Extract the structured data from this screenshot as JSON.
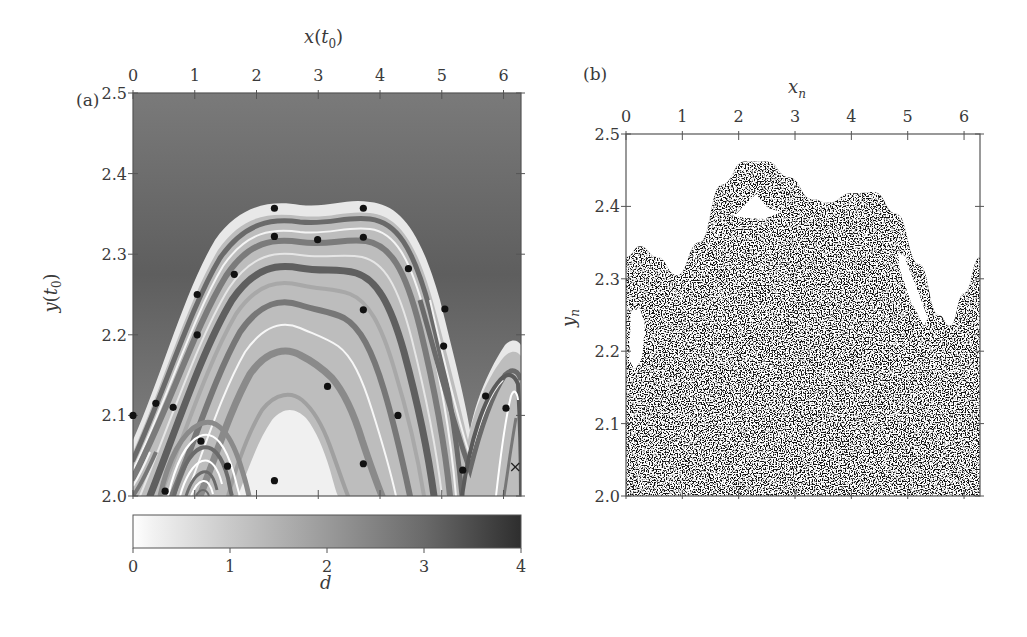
{
  "chart_data": [
    {
      "type": "heatmap",
      "panel_label": "(a)",
      "title": "",
      "xlabel": "x(t0)",
      "xlabel_main": "x",
      "xlabel_paren_open": "(",
      "xlabel_t": "t",
      "xlabel_sub": "0",
      "xlabel_paren_close": ")",
      "ylabel": "y(t0)",
      "xlim": [
        0,
        6.283
      ],
      "ylim": [
        2.0,
        2.5
      ],
      "xticks": [
        "0",
        "1",
        "2",
        "3",
        "4",
        "5",
        "6"
      ],
      "xtick_values": [
        0,
        1,
        2,
        3,
        4,
        5,
        6
      ],
      "yticks": [
        "2.0",
        "2.1",
        "2.2",
        "2.3",
        "2.4",
        "2.5"
      ],
      "ytick_values": [
        2.0,
        2.1,
        2.2,
        2.3,
        2.4,
        2.5
      ],
      "xaxis_position": "top",
      "grid": false,
      "colormap": "grayscale (white = 0, black = 4)",
      "colorbar": {
        "label": "d",
        "ticks": [
          "0",
          "1",
          "2",
          "3",
          "4"
        ],
        "tick_values": [
          0,
          1,
          2,
          3,
          4
        ],
        "range": [
          0,
          4
        ],
        "orientation": "horizontal",
        "low_color": "#ffffff",
        "high_color": "#2a2a2a"
      },
      "markers": {
        "style": "filled black circles",
        "points": [
          {
            "x": 0.0,
            "y": 2.1
          },
          {
            "x": 0.37,
            "y": 2.115
          },
          {
            "x": 0.65,
            "y": 2.11
          },
          {
            "x": 1.04,
            "y": 2.25
          },
          {
            "x": 1.04,
            "y": 2.2
          },
          {
            "x": 1.64,
            "y": 2.275
          },
          {
            "x": 2.29,
            "y": 2.357
          },
          {
            "x": 2.29,
            "y": 2.322
          },
          {
            "x": 2.99,
            "y": 2.318
          },
          {
            "x": 3.73,
            "y": 2.357
          },
          {
            "x": 3.73,
            "y": 2.321
          },
          {
            "x": 4.46,
            "y": 2.282
          },
          {
            "x": 5.05,
            "y": 2.232
          },
          {
            "x": 5.03,
            "y": 2.186
          },
          {
            "x": 3.73,
            "y": 2.231
          },
          {
            "x": 3.15,
            "y": 2.136
          },
          {
            "x": 4.29,
            "y": 2.1
          },
          {
            "x": 5.71,
            "y": 2.124
          },
          {
            "x": 6.04,
            "y": 2.109
          },
          {
            "x": 1.1,
            "y": 2.068
          },
          {
            "x": 1.53,
            "y": 2.037
          },
          {
            "x": 0.52,
            "y": 2.006
          },
          {
            "x": 2.29,
            "y": 2.019
          },
          {
            "x": 3.73,
            "y": 2.04
          },
          {
            "x": 5.34,
            "y": 2.032
          }
        ],
        "cross": {
          "x": 6.19,
          "y": 2.036
        }
      }
    },
    {
      "type": "scatter",
      "panel_label": "(b)",
      "title": "",
      "xlabel": "x_n",
      "xlabel_main": "x",
      "xlabel_sub": "n",
      "ylabel": "y_n",
      "ylabel_main": "y",
      "ylabel_sub": "n",
      "xlim": [
        0,
        6.283
      ],
      "ylim": [
        2.0,
        2.5
      ],
      "xticks": [
        "0",
        "1",
        "2",
        "3",
        "4",
        "5",
        "6"
      ],
      "xtick_values": [
        0,
        1,
        2,
        3,
        4,
        5,
        6
      ],
      "yticks": [
        "2.0",
        "2.1",
        "2.2",
        "2.3",
        "2.4",
        "2.5"
      ],
      "ytick_values": [
        2.0,
        2.1,
        2.2,
        2.3,
        2.4,
        2.5
      ],
      "xaxis_position": "top",
      "grid": false,
      "description": "Dense chaotic sea of black points filling y from 2.0 up to a wavy upper boundary, with small white KAM islands",
      "upper_boundary": [
        {
          "x": 0.0,
          "y": 2.33
        },
        {
          "x": 0.25,
          "y": 2.345
        },
        {
          "x": 0.55,
          "y": 2.33
        },
        {
          "x": 0.9,
          "y": 2.305
        },
        {
          "x": 1.3,
          "y": 2.35
        },
        {
          "x": 1.7,
          "y": 2.43
        },
        {
          "x": 2.1,
          "y": 2.462
        },
        {
          "x": 2.5,
          "y": 2.462
        },
        {
          "x": 2.9,
          "y": 2.44
        },
        {
          "x": 3.3,
          "y": 2.41
        },
        {
          "x": 3.6,
          "y": 2.405
        },
        {
          "x": 4.0,
          "y": 2.418
        },
        {
          "x": 4.4,
          "y": 2.42
        },
        {
          "x": 4.8,
          "y": 2.39
        },
        {
          "x": 5.2,
          "y": 2.32
        },
        {
          "x": 5.55,
          "y": 2.25
        },
        {
          "x": 5.75,
          "y": 2.235
        },
        {
          "x": 6.0,
          "y": 2.28
        },
        {
          "x": 6.283,
          "y": 2.33
        }
      ],
      "islands": [
        {
          "x_center": 0.08,
          "y_center": 2.22,
          "shape": "narrow vertical"
        },
        {
          "x_center": 2.2,
          "y_center": 2.41,
          "shape": "triangular"
        },
        {
          "x_center": 4.95,
          "y_center": 2.31,
          "shape": "diagonal sliver"
        }
      ]
    }
  ]
}
